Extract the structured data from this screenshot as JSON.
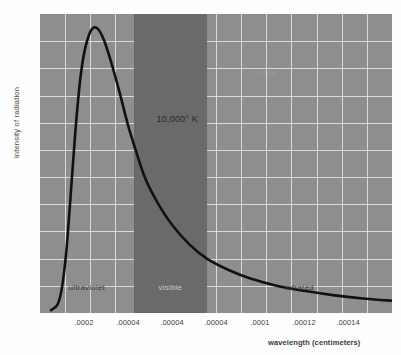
{
  "chart_data": {
    "type": "line",
    "title": "",
    "xlabel": "wavelength (centimeters)",
    "ylabel": "intensity of radiation",
    "grid": true,
    "legend": "none",
    "xlim": [
      0,
      0.00016
    ],
    "ylim": [
      0,
      1.05
    ],
    "xtick_labels": [
      ".0002",
      ".00004",
      ".00004",
      ".00004",
      ".0001",
      ".00012",
      ".00014"
    ],
    "xtick_positions": [
      2e-05,
      4e-05,
      6e-05,
      8e-05,
      0.0001,
      0.00012,
      0.00014
    ],
    "ytick_labels": [],
    "series": [
      {
        "name": "10,000 K blackbody",
        "color": "#111111",
        "x": [
          5e-06,
          8e-06,
          1e-05,
          1.2e-05,
          1.4e-05,
          1.6e-05,
          1.8e-05,
          2e-05,
          2.3e-05,
          2.6e-05,
          2.9e-05,
          3.2e-05,
          3.6e-05,
          4e-05,
          4.4e-05,
          4.8e-05,
          5.4e-05,
          6e-05,
          6.8e-05,
          7.6e-05,
          8.6e-05,
          9.6e-05,
          0.000108,
          0.00012,
          0.000134,
          0.000148,
          0.00016
        ],
        "y": [
          0.01,
          0.03,
          0.09,
          0.22,
          0.42,
          0.63,
          0.8,
          0.91,
          0.99,
          1.0,
          0.96,
          0.89,
          0.78,
          0.66,
          0.56,
          0.47,
          0.38,
          0.31,
          0.24,
          0.19,
          0.15,
          0.12,
          0.095,
          0.078,
          0.062,
          0.05,
          0.043
        ]
      }
    ],
    "bands": [
      {
        "name": "ultraviolet",
        "label": "ultraviolet",
        "x_start": 0.0,
        "x_end": 4.25e-05,
        "shaded": false
      },
      {
        "name": "visible",
        "label": "visible",
        "x_start": 4.25e-05,
        "x_end": 7.6e-05,
        "shaded": true,
        "color": "#6a6a6a"
      },
      {
        "name": "infrared",
        "label": "infrared",
        "x_start": 7.6e-05,
        "x_end": 0.00016,
        "shaded": false
      }
    ],
    "annotations": [
      {
        "name": "temperature",
        "text": "10,000° K",
        "x": 5.3e-05,
        "y": 0.7
      },
      {
        "name": "star-name",
        "text": "Sirius",
        "x": 9.7e-05,
        "y": 0.86
      }
    ],
    "background_color": "#8e8e8e",
    "gridline_color": "#e8e8e8",
    "curve_color": "#111111"
  },
  "axes": {
    "y_title": "intensity of radiation",
    "x_title": "wavelength (centimeters)"
  },
  "band_labels": {
    "ultraviolet": "ultraviolet",
    "visible": "visible",
    "infrared": "infrared"
  },
  "annotations": {
    "temperature": "10,000° K",
    "star": "Sirius"
  }
}
